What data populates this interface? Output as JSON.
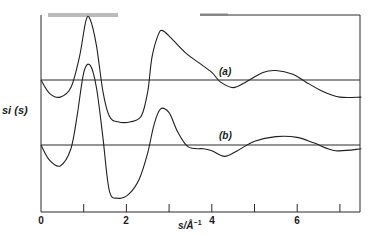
{
  "chart_data": {
    "type": "line",
    "title": "",
    "xlabel": "s/Å⁻¹",
    "ylabel": "si (s)",
    "xlim": [
      0,
      7.5
    ],
    "x_ticks": [
      0,
      1,
      2,
      3,
      4,
      5,
      6,
      7
    ],
    "x_tick_labels": [
      "0",
      "2",
      "4",
      "6"
    ],
    "x_tick_label_values": [
      0,
      2,
      4,
      6
    ],
    "grid": false,
    "legend": "inline labels on curves",
    "baselines": [
      {
        "name": "(a)",
        "y_offset_px": 80
      },
      {
        "name": "(b)",
        "y_offset_px": 145
      }
    ],
    "series": [
      {
        "name": "(a)",
        "label": "(a)",
        "label_pos": {
          "s": 4.35
        },
        "points": [
          [
            0,
            0
          ],
          [
            0.2,
            -0.35
          ],
          [
            0.45,
            -0.45
          ],
          [
            0.7,
            -0.2
          ],
          [
            0.9,
            0.6
          ],
          [
            1.05,
            1.55
          ],
          [
            1.15,
            1.6
          ],
          [
            1.3,
            0.9
          ],
          [
            1.45,
            -0.3
          ],
          [
            1.6,
            -0.95
          ],
          [
            1.8,
            -1.1
          ],
          [
            2.1,
            -1.1
          ],
          [
            2.35,
            -0.95
          ],
          [
            2.5,
            -0.3
          ],
          [
            2.6,
            0.6
          ],
          [
            2.75,
            1.2
          ],
          [
            2.85,
            1.3
          ],
          [
            3.05,
            1.1
          ],
          [
            3.4,
            0.7
          ],
          [
            3.7,
            0.45
          ],
          [
            4.0,
            0.2
          ],
          [
            4.2,
            -0.05
          ],
          [
            4.5,
            -0.2
          ],
          [
            4.8,
            -0.05
          ],
          [
            5.2,
            0.2
          ],
          [
            5.5,
            0.25
          ],
          [
            5.9,
            0.15
          ],
          [
            6.2,
            -0.05
          ],
          [
            6.6,
            -0.3
          ],
          [
            7.0,
            -0.45
          ],
          [
            7.5,
            -0.45
          ]
        ]
      },
      {
        "name": "(b)",
        "label": "(b)",
        "label_pos": {
          "s": 4.35
        },
        "points": [
          [
            0,
            0
          ],
          [
            0.2,
            -0.4
          ],
          [
            0.45,
            -0.55
          ],
          [
            0.7,
            -0.1
          ],
          [
            0.85,
            0.8
          ],
          [
            1.0,
            1.9
          ],
          [
            1.15,
            2.1
          ],
          [
            1.3,
            1.5
          ],
          [
            1.45,
            0.2
          ],
          [
            1.6,
            -1.2
          ],
          [
            1.8,
            -1.4
          ],
          [
            2.05,
            -1.3
          ],
          [
            2.3,
            -0.9
          ],
          [
            2.5,
            -0.2
          ],
          [
            2.65,
            0.55
          ],
          [
            2.8,
            0.95
          ],
          [
            3.0,
            0.85
          ],
          [
            3.2,
            0.35
          ],
          [
            3.45,
            -0.05
          ],
          [
            3.8,
            -0.1
          ],
          [
            4.0,
            -0.15
          ],
          [
            4.3,
            -0.3
          ],
          [
            4.6,
            -0.15
          ],
          [
            5.0,
            0.1
          ],
          [
            5.5,
            0.22
          ],
          [
            6.0,
            0.2
          ],
          [
            6.4,
            0.05
          ],
          [
            6.9,
            -0.15
          ],
          [
            7.5,
            -0.1
          ]
        ]
      }
    ]
  },
  "labels": {
    "ylabel": "si (s)",
    "xlabel_main": "s/Å",
    "xlabel_sup": "−1",
    "curve_a": "(a)",
    "curve_b": "(b)",
    "ticks": [
      "0",
      "2",
      "4",
      "6"
    ]
  }
}
